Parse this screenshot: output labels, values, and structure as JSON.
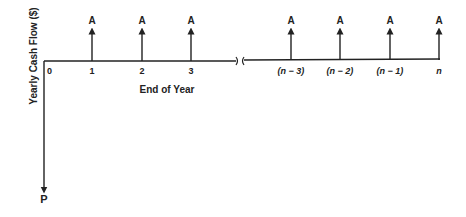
{
  "y_axis_label": "Yearly Cash Flow ($)",
  "x_axis_label": "End of Year",
  "present_value_label": "P",
  "origin_label": "0",
  "payment_label": "A",
  "periods_left": [
    {
      "label": "1",
      "x": 92
    },
    {
      "label": "2",
      "x": 142
    },
    {
      "label": "3",
      "x": 191
    }
  ],
  "periods_right": [
    {
      "label": "(n − 3)",
      "x": 291
    },
    {
      "label": "(n − 2)",
      "x": 340
    },
    {
      "label": "(n − 1)",
      "x": 390
    },
    {
      "label": "n",
      "x": 439
    }
  ],
  "colors": {
    "ink": "#222222",
    "background": "#ffffff"
  }
}
